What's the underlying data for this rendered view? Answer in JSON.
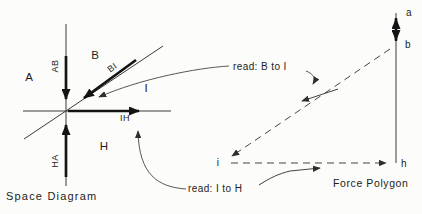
{
  "figure": {
    "background": "#fcfcfa",
    "ink": "#1c1c1c"
  },
  "space_diagram": {
    "caption": "Space Diagram",
    "region_labels": {
      "A": "A",
      "B": "B",
      "I": "I",
      "H": "H"
    },
    "member_labels": {
      "AB": "AB",
      "BI": "BI",
      "IH": "IH",
      "HA": "HA"
    }
  },
  "force_polygon": {
    "caption": "Force Polygon",
    "vertex_labels": {
      "a": "a",
      "b": "b",
      "i": "i",
      "h": "h"
    }
  },
  "callouts": {
    "read_b_to_i": "read: B to I",
    "read_i_to_h": "read: I to H"
  }
}
